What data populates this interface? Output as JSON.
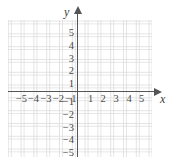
{
  "figure": {
    "kind": "cartesian-coordinate-plane",
    "background_color": "#ffffff",
    "axis_color": "#555555",
    "grid_color": "#e3e3e3",
    "label_color": "#4a4a4a"
  },
  "axes": {
    "x_name": "x",
    "y_name": "y",
    "origin_label": ""
  },
  "chart_data": {
    "type": "scatter",
    "title": "",
    "xlabel": "x",
    "ylabel": "y",
    "xlim": [
      -5.5,
      5.8
    ],
    "ylim": [
      -5.6,
      5.7
    ],
    "grid": true,
    "grid_spacing": 1,
    "legend": null,
    "series": [],
    "x": [],
    "y": [],
    "xticks": [
      -5,
      -4,
      -3,
      -2,
      -1,
      1,
      2,
      3,
      4,
      5
    ],
    "yticks": [
      5,
      4,
      3,
      2,
      1,
      -1,
      -2,
      -3,
      -4,
      -5
    ],
    "xtick_labels": [
      "−5",
      "−4",
      "−3",
      "−2",
      "−1",
      "1",
      "2",
      "3",
      "4",
      "5"
    ],
    "ytick_labels": [
      "5",
      "4",
      "3",
      "2",
      "1",
      "−1",
      "−2",
      "−3",
      "−4",
      "−5"
    ],
    "annotations": []
  },
  "ticks": {
    "x_negative": [
      {
        "label": "−5",
        "value": -5,
        "left": 15
      },
      {
        "label": "−4",
        "value": -4,
        "left": 27
      },
      {
        "label": "−3",
        "value": -3,
        "left": 39.5
      },
      {
        "label": "−2",
        "value": -2,
        "left": 52
      },
      {
        "label": "−1",
        "value": -1,
        "left": 64.5
      }
    ],
    "x_positive": [
      {
        "label": "1",
        "value": 1,
        "left": 84
      },
      {
        "label": "2",
        "value": 2,
        "left": 96.5
      },
      {
        "label": "3",
        "value": 3,
        "left": 109.5
      },
      {
        "label": "4",
        "value": 4,
        "left": 122.5
      },
      {
        "label": "5",
        "value": 5,
        "left": 135
      }
    ],
    "y_positive": [
      {
        "label": "5",
        "value": 5,
        "top": 28
      },
      {
        "label": "4",
        "value": 4,
        "top": 41
      },
      {
        "label": "3",
        "value": 3,
        "top": 53.5
      },
      {
        "label": "2",
        "value": 2,
        "top": 66
      },
      {
        "label": "1",
        "value": 1,
        "top": 78.5
      }
    ],
    "y_negative": [
      {
        "label": "−1",
        "value": -1,
        "top": 97
      },
      {
        "label": "−2",
        "value": -2,
        "top": 110
      },
      {
        "label": "−3",
        "value": -3,
        "top": 122.5
      },
      {
        "label": "−4",
        "value": -4,
        "top": 135
      },
      {
        "label": "−5",
        "value": -5,
        "top": 147.5
      }
    ]
  }
}
